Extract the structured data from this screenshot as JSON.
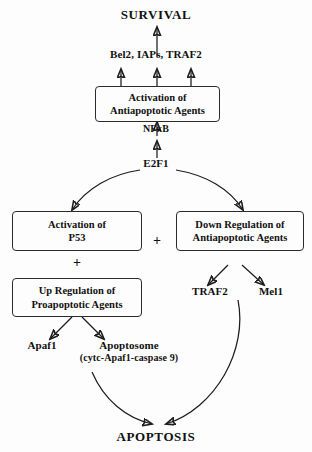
{
  "diagram": {
    "type": "biological-pathway-flowchart",
    "title_top": "SURVIVAL",
    "title_bottom": "APOPTOSIS",
    "background_color": "#fdfdfd",
    "stroke_color": "#1d1d1d"
  },
  "nodes": {
    "survival": "SURVIVAL",
    "antiapoptotic_effectors": "Bel2, IAPs, TRAF2",
    "nfkb": "NFκB",
    "e2f1": "E2F1",
    "traf2": "TRAF2",
    "mcl1": "Mel1",
    "apaf1": "Apaf1",
    "apoptosome_line1": "Apoptosome",
    "apoptosome_line2": "(cytc-Apaf1-caspase 9)",
    "apoptosis": "APOPTOSIS"
  },
  "boxes": {
    "activation_antiapoptotic": {
      "line1": "Activation of",
      "line2": "Antiapoptotic Agents"
    },
    "activation_p53": {
      "line1": "Activation of",
      "line2": "P53"
    },
    "up_regulation_proapoptotic": {
      "line1": "Up Regulation of",
      "line2": "Proapoptotic Agents"
    },
    "down_regulation_antiapoptotic": {
      "line1": "Down Regulation of",
      "line2": "Antiapoptotic Agents"
    }
  },
  "operators": {
    "plus_left": "+",
    "plus_center": "+"
  }
}
